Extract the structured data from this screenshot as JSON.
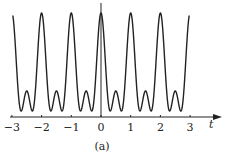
{
  "figure": {
    "caption": "(a)",
    "x_axis_label": "t"
  },
  "chart_data": {
    "type": "line",
    "title": "",
    "caption": "(a)",
    "xlabel": "t",
    "ylabel": "",
    "xlim": [
      -3,
      3
    ],
    "x_ticks": [
      -3,
      -2,
      -1,
      0,
      1,
      2,
      3
    ],
    "x_tick_labels": [
      "−3",
      "−2",
      "−1",
      "0",
      "1",
      "2",
      "3"
    ],
    "grid": false,
    "y_axis_ticks": false,
    "function_model": "y = (cos(2πt) + 0.377)^2",
    "series": [
      {
        "name": "waveform",
        "x": [
          -3,
          -2.5,
          -2,
          -1.5,
          -1,
          -0.5,
          0,
          0.5,
          1,
          1.5,
          2,
          2.5,
          3
        ],
        "values": [
          1.0,
          0.2,
          1.0,
          0.2,
          1.0,
          0.2,
          1.0,
          0.2,
          1.0,
          0.2,
          1.0,
          0.2,
          1.0
        ]
      }
    ],
    "minima_t_offsets_from_half_integer": [
      -0.19,
      0.19
    ],
    "relative_peak_height": 1.0,
    "relative_bump_height": 0.2,
    "relative_minimum": 0.0,
    "colors": {
      "curve": "#222222",
      "axis": "#222222"
    }
  }
}
